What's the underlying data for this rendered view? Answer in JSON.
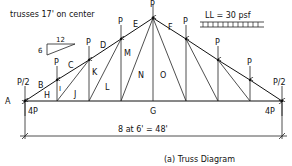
{
  "notes": {
    "spacing": "trusses 17' on center",
    "live_load": "LL = 30 psf"
  },
  "slope": {
    "rise": "6",
    "run": "12"
  },
  "loads": {
    "end_load": "P/2",
    "panel_load": "P",
    "reaction": "4P"
  },
  "dimension": {
    "text": "8 at 6' = 48'"
  },
  "caption": "(a)  Truss Diagram",
  "space_labels": {
    "top": [
      "A",
      "B",
      "C",
      "D",
      "E",
      "F"
    ],
    "inner": [
      "H",
      "I",
      "J",
      "K",
      "L",
      "M",
      "N",
      "O"
    ],
    "bottom": "G"
  },
  "labels": {
    "A": "A",
    "B": "B",
    "C": "C",
    "D": "D",
    "E": "E",
    "F": "F",
    "G": "G",
    "H": "H",
    "I": "I",
    "J": "J",
    "K": "K",
    "L": "L",
    "M": "M",
    "N": "N",
    "O": "O"
  }
}
